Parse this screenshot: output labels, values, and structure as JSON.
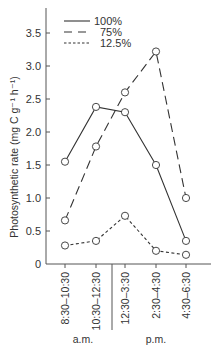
{
  "chart_data": {
    "type": "line",
    "title": "",
    "xlabel": "",
    "ylabel": "Photosynthetic rate (mg C g⁻¹ h⁻¹)",
    "categories": [
      "8:30–10:30",
      "10:30–12:30",
      "12:30–3:30",
      "2:30–4:30",
      "4:30–6:30"
    ],
    "category_groups": [
      {
        "label": "a.m.",
        "categories": [
          0,
          1
        ]
      },
      {
        "label": "p.m.",
        "categories": [
          2,
          3,
          4
        ]
      }
    ],
    "ylim": [
      0,
      3.8
    ],
    "yticks": [
      0,
      0.5,
      1.0,
      1.5,
      2.0,
      2.5,
      3.0,
      3.5
    ],
    "ytick_labels": [
      "0",
      "0.5",
      "1.0",
      "1.5",
      "2.0",
      "2.5",
      "3.0",
      "3.5"
    ],
    "grid": false,
    "legend_position": "upper left (inside)",
    "series": [
      {
        "name": "100%",
        "style": "solid",
        "values": [
          1.55,
          2.38,
          2.3,
          1.5,
          0.35
        ]
      },
      {
        "name": "75%",
        "style": "long-dash",
        "values": [
          0.66,
          1.78,
          2.6,
          3.22,
          1.0
        ]
      },
      {
        "name": "12.5%",
        "style": "short-dash",
        "values": [
          0.28,
          0.35,
          0.73,
          0.2,
          0.14
        ]
      }
    ],
    "marker": "open-circle"
  }
}
